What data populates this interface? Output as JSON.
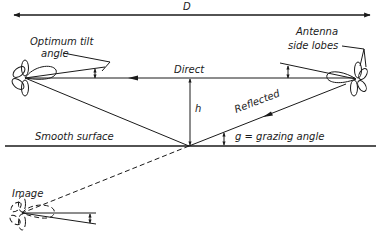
{
  "diagram": {
    "type": "radar multipath geometry",
    "labels": {
      "distance": "D",
      "tilt": "Optimum tilt",
      "tilt_line2": "angle",
      "direct": "Direct",
      "height": "h",
      "reflected": "Reflected",
      "grazing": "g = grazing angle",
      "surface": "Smooth surface",
      "side_lobes_line1": "Antenna",
      "side_lobes_line2": "side lobes",
      "image": "Image"
    },
    "colors": {
      "ink": "#1a1a1a",
      "background": "#ffffff"
    }
  }
}
